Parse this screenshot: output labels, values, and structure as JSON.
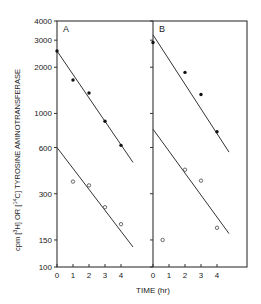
{
  "chart_data": {
    "type": "scatter",
    "title": "",
    "xlabel": "TIME (hr)",
    "ylabel": "cpm [3H] OR [14C] TYROSINE AMINOTRANSFERASE",
    "yscale": "log",
    "ylim": [
      100,
      4000
    ],
    "yticks": [
      4000,
      3000,
      2000,
      1000,
      600,
      300,
      150,
      100
    ],
    "ytick_labels": [
      "4000",
      "3000",
      "2000",
      "1000",
      "600",
      "300",
      "150",
      "100"
    ],
    "xticks": [
      0,
      1,
      2,
      3,
      4
    ],
    "xtick_labels": [
      "0",
      "1",
      "2",
      "3",
      "4"
    ],
    "grid": false,
    "panels": [
      {
        "label": "A",
        "series": [
          {
            "name": "closed circles",
            "marker": "filled",
            "x": [
              0,
              1,
              2,
              3,
              4
            ],
            "y": [
              2550,
              1650,
              1360,
              890,
              620
            ],
            "fit_line": {
              "x": [
                0,
                4.75
              ],
              "y": [
                2550,
                480
              ]
            }
          },
          {
            "name": "open circles",
            "marker": "open",
            "x": [
              1,
              2,
              3,
              4
            ],
            "y": [
              360,
              340,
              245,
              190
            ],
            "fit_line": {
              "x": [
                0,
                4.75
              ],
              "y": [
                600,
                135
              ]
            }
          }
        ]
      },
      {
        "label": "B",
        "series": [
          {
            "name": "closed circles",
            "marker": "filled",
            "x": [
              0,
              2,
              3,
              4
            ],
            "y": [
              2900,
              1850,
              1330,
              760
            ],
            "fit_line": {
              "x": [
                0,
                4.75
              ],
              "y": [
                3250,
                560
              ]
            }
          },
          {
            "name": "open circles",
            "marker": "open",
            "x": [
              0.6,
              2,
              3,
              4
            ],
            "y": [
              150,
              430,
              365,
              180
            ],
            "fit_line": {
              "x": [
                0,
                4.75
              ],
              "y": [
                790,
                165
              ]
            }
          }
        ]
      }
    ]
  }
}
